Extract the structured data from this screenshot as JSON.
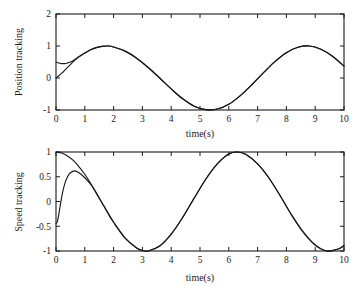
{
  "figure": {
    "background": "#ffffff",
    "line_color": "#1a1a1a",
    "panel_count": 2
  },
  "chart_data": [
    {
      "id": "position-tracking",
      "type": "line",
      "title": "",
      "xlabel": "time(s)",
      "ylabel": "Position tracking",
      "xlim": [
        0,
        10
      ],
      "ylim": [
        -1,
        2
      ],
      "xticks": [
        0,
        1,
        2,
        3,
        4,
        5,
        6,
        7,
        8,
        9,
        10
      ],
      "xtick_labels": [
        "0",
        "1",
        "2",
        "3",
        "4",
        "5",
        "6",
        "7",
        "8",
        "9",
        "10"
      ],
      "yticks": [
        -1,
        0,
        1,
        2
      ],
      "ytick_labels": [
        "-1",
        "0",
        "1",
        "2"
      ],
      "grid": false,
      "legend": "none",
      "series": [
        {
          "name": "reference",
          "color": "#1a1a1a",
          "x": [
            0,
            0.1,
            0.2,
            0.3,
            0.4,
            0.5,
            0.6,
            0.7,
            0.8,
            0.9,
            1.0,
            1.2,
            1.4,
            1.6,
            1.8,
            2.0,
            2.4,
            2.8,
            3.2,
            3.6,
            4.0,
            4.4,
            4.8,
            5.2,
            5.6,
            6.0,
            6.4,
            6.8,
            7.2,
            7.6,
            8.0,
            8.4,
            8.8,
            9.2,
            9.6,
            10.0
          ],
          "values": [
            0.5,
            0.47,
            0.45,
            0.45,
            0.47,
            0.5,
            0.55,
            0.61,
            0.67,
            0.73,
            0.78,
            0.88,
            0.95,
            0.99,
            1.0,
            0.97,
            0.84,
            0.62,
            0.33,
            0.0,
            -0.34,
            -0.65,
            -0.88,
            -0.99,
            -0.97,
            -0.82,
            -0.55,
            -0.21,
            0.16,
            0.51,
            0.79,
            0.96,
            1.0,
            0.9,
            0.68,
            0.37
          ]
        },
        {
          "name": "tracking",
          "color": "#1a1a1a",
          "x": [
            0,
            0.1,
            0.2,
            0.3,
            0.4,
            0.5,
            0.6,
            0.7,
            0.8,
            0.9,
            1.0,
            1.2,
            1.4,
            1.6,
            1.8,
            2.0,
            2.4,
            2.8,
            3.2,
            3.6,
            4.0,
            4.4,
            4.8,
            5.2,
            5.6,
            6.0,
            6.4,
            6.8,
            7.2,
            7.6,
            8.0,
            8.4,
            8.8,
            9.2,
            9.6,
            10.0
          ],
          "values": [
            0.0,
            0.07,
            0.15,
            0.24,
            0.33,
            0.42,
            0.51,
            0.59,
            0.66,
            0.72,
            0.78,
            0.88,
            0.95,
            0.99,
            1.0,
            0.97,
            0.84,
            0.62,
            0.33,
            0.0,
            -0.34,
            -0.65,
            -0.88,
            -0.99,
            -0.97,
            -0.82,
            -0.55,
            -0.21,
            0.16,
            0.51,
            0.79,
            0.96,
            1.0,
            0.9,
            0.68,
            0.37
          ]
        }
      ]
    },
    {
      "id": "speed-tracking",
      "type": "line",
      "title": "",
      "xlabel": "time(s)",
      "ylabel": "Speed tracking",
      "xlim": [
        0,
        10
      ],
      "ylim": [
        -1,
        1
      ],
      "xticks": [
        0,
        1,
        2,
        3,
        4,
        5,
        6,
        7,
        8,
        9,
        10
      ],
      "xtick_labels": [
        "0",
        "1",
        "2",
        "3",
        "4",
        "5",
        "6",
        "7",
        "8",
        "9",
        "10"
      ],
      "yticks": [
        -1,
        -0.5,
        0,
        0.5,
        1
      ],
      "ytick_labels": [
        "-1",
        "-0.5",
        "0",
        "0.5",
        "1"
      ],
      "grid": false,
      "legend": "none",
      "series": [
        {
          "name": "reference",
          "color": "#1a1a1a",
          "x": [
            0,
            0.2,
            0.4,
            0.6,
            0.8,
            1.0,
            1.2,
            1.4,
            1.6,
            1.8,
            2.0,
            2.4,
            2.8,
            3.0,
            3.2,
            3.6,
            4.0,
            4.4,
            4.8,
            5.2,
            5.6,
            6.0,
            6.3,
            6.6,
            7.0,
            7.4,
            7.8,
            8.2,
            8.6,
            9.0,
            9.4,
            9.8,
            10.0
          ],
          "values": [
            1.0,
            0.98,
            0.92,
            0.83,
            0.7,
            0.55,
            0.37,
            0.17,
            -0.03,
            -0.23,
            -0.42,
            -0.74,
            -0.94,
            -0.99,
            -1.0,
            -0.9,
            -0.66,
            -0.32,
            0.07,
            0.45,
            0.76,
            0.96,
            1.0,
            0.95,
            0.76,
            0.47,
            0.1,
            -0.29,
            -0.63,
            -0.88,
            -1.0,
            -0.96,
            -0.89
          ]
        },
        {
          "name": "tracking",
          "color": "#1a1a1a",
          "x": [
            0,
            0.05,
            0.1,
            0.2,
            0.3,
            0.4,
            0.5,
            0.65,
            0.8,
            1.0,
            1.2,
            1.4,
            1.6,
            1.8,
            2.0,
            2.4,
            2.8,
            3.0,
            3.2,
            3.6,
            4.0,
            4.4,
            4.8,
            5.2,
            5.6,
            6.0,
            6.3,
            6.6,
            7.0,
            7.4,
            7.8,
            8.2,
            8.6,
            9.0,
            9.4,
            9.8,
            10.0
          ],
          "values": [
            -0.45,
            -0.4,
            -0.25,
            0.1,
            0.35,
            0.5,
            0.58,
            0.62,
            0.58,
            0.48,
            0.35,
            0.17,
            -0.03,
            -0.23,
            -0.42,
            -0.74,
            -0.94,
            -0.99,
            -1.0,
            -0.9,
            -0.66,
            -0.32,
            0.07,
            0.45,
            0.76,
            0.96,
            1.0,
            0.95,
            0.76,
            0.47,
            0.1,
            -0.29,
            -0.63,
            -0.88,
            -1.0,
            -0.96,
            -0.89
          ]
        }
      ]
    }
  ]
}
